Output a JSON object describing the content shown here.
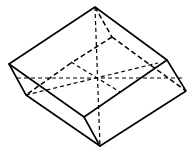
{
  "figure": {
    "title": "",
    "stroke_color": "#000000",
    "background_color": "#ffffff",
    "vertices": {
      "A_top": [
        95,
        7
      ],
      "B_left": [
        9,
        64
      ],
      "C_right": [
        167,
        60
      ],
      "D_front": [
        84,
        117
      ],
      "E_left_bottom": [
        26,
        95
      ],
      "F_right_bottom": [
        186,
        91
      ],
      "G_bottom": [
        100,
        146
      ],
      "H_hidden_back": [
        112,
        37
      ],
      "I_hidden_left": [
        71,
        64
      ],
      "O_center": [
        97,
        79
      ]
    },
    "solid_edges": [
      [
        "A_top",
        "B_left"
      ],
      [
        "A_top",
        "C_right"
      ],
      [
        "B_left",
        "D_front"
      ],
      [
        "C_right",
        "D_front"
      ],
      [
        "B_left",
        "E_left_bottom"
      ],
      [
        "C_right",
        "F_right_bottom"
      ],
      [
        "D_front",
        "G_bottom"
      ],
      [
        "E_left_bottom",
        "G_bottom"
      ],
      [
        "F_right_bottom",
        "G_bottom"
      ]
    ],
    "dashed_edges": [
      [
        "A_top",
        "H_hidden_back"
      ],
      [
        "H_hidden_back",
        "F_right_bottom"
      ],
      [
        "H_hidden_back",
        "I_hidden_left"
      ],
      [
        "I_hidden_left",
        "E_left_bottom"
      ],
      [
        "A_top",
        "G_bottom"
      ],
      [
        "B_left",
        "F_right_bottom"
      ],
      [
        "E_left_bottom",
        "C_right"
      ]
    ]
  }
}
